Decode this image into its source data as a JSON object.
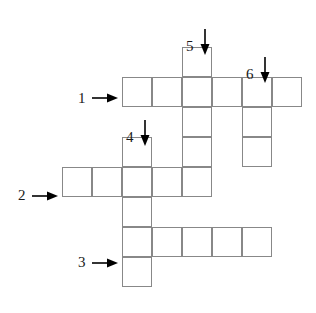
{
  "puzzle": {
    "type": "crossword-grid",
    "cell_size": 30,
    "grid_origin": {
      "x": 62,
      "y": 47
    },
    "background_color": "#ffffff",
    "cell_border_color": "#888888",
    "label_color": "#1a1a1a",
    "arrow_color": "#000000",
    "across_entries": [
      {
        "number": "1",
        "row": 1,
        "start_col": 2,
        "length": 6
      },
      {
        "number": "2",
        "row": 4,
        "start_col": 0,
        "length": 5
      },
      {
        "number": "3",
        "row": 6,
        "start_col": 2,
        "length": 5
      }
    ],
    "down_entries": [
      {
        "number": "4",
        "col": 2,
        "start_row": 3,
        "length": 5
      },
      {
        "number": "5",
        "col": 4,
        "start_row": 0,
        "length": 5
      },
      {
        "number": "6",
        "col": 6,
        "start_row": 1,
        "length": 3
      }
    ],
    "cells": [
      {
        "row": 0,
        "col": 4
      },
      {
        "row": 1,
        "col": 2
      },
      {
        "row": 1,
        "col": 3
      },
      {
        "row": 1,
        "col": 4
      },
      {
        "row": 1,
        "col": 5
      },
      {
        "row": 1,
        "col": 6
      },
      {
        "row": 1,
        "col": 7
      },
      {
        "row": 2,
        "col": 4
      },
      {
        "row": 2,
        "col": 6
      },
      {
        "row": 3,
        "col": 2
      },
      {
        "row": 3,
        "col": 4
      },
      {
        "row": 3,
        "col": 6
      },
      {
        "row": 4,
        "col": 0
      },
      {
        "row": 4,
        "col": 1
      },
      {
        "row": 4,
        "col": 2
      },
      {
        "row": 4,
        "col": 3
      },
      {
        "row": 4,
        "col": 4
      },
      {
        "row": 5,
        "col": 2
      },
      {
        "row": 6,
        "col": 2
      },
      {
        "row": 6,
        "col": 3
      },
      {
        "row": 6,
        "col": 4
      },
      {
        "row": 6,
        "col": 5
      },
      {
        "row": 6,
        "col": 6
      },
      {
        "row": 7,
        "col": 2
      }
    ],
    "labels": [
      {
        "name": "clue-number-1",
        "text": "1",
        "x": 78,
        "y": 91,
        "direction": "across"
      },
      {
        "name": "clue-number-2",
        "text": "2",
        "x": 18,
        "y": 188,
        "direction": "across"
      },
      {
        "name": "clue-number-3",
        "text": "3",
        "x": 78,
        "y": 255,
        "direction": "across"
      },
      {
        "name": "clue-number-4",
        "text": "4",
        "x": 126,
        "y": 130,
        "direction": "down"
      },
      {
        "name": "clue-number-5",
        "text": "5",
        "x": 186,
        "y": 39,
        "direction": "down"
      },
      {
        "name": "clue-number-6",
        "text": "6",
        "x": 246,
        "y": 67,
        "direction": "down"
      }
    ],
    "arrows": [
      {
        "name": "arrow-across-1",
        "kind": "right",
        "x": 92,
        "y": 92
      },
      {
        "name": "arrow-across-2",
        "kind": "right",
        "x": 32,
        "y": 190
      },
      {
        "name": "arrow-across-3",
        "kind": "right",
        "x": 92,
        "y": 257
      },
      {
        "name": "arrow-down-4",
        "kind": "down",
        "x": 139,
        "y": 120
      },
      {
        "name": "arrow-down-5",
        "kind": "down",
        "x": 199,
        "y": 29
      },
      {
        "name": "arrow-down-6",
        "kind": "down",
        "x": 259,
        "y": 57
      }
    ]
  }
}
